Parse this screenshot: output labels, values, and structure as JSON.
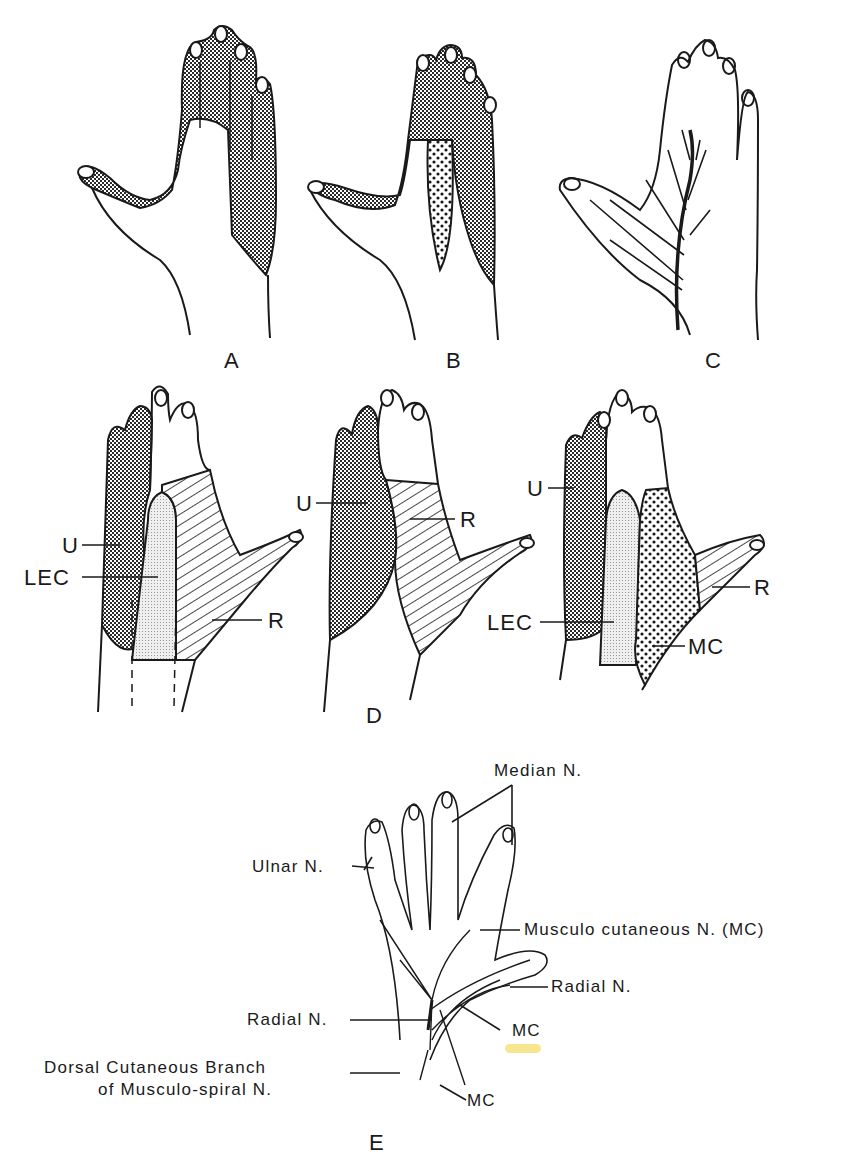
{
  "figure": {
    "panels": {
      "A": {
        "letter": "A"
      },
      "B": {
        "letter": "B"
      },
      "C": {
        "letter": "C"
      },
      "D": {
        "letter": "D",
        "hand1": {
          "labels": {
            "U": "U",
            "LEC": "LEC",
            "R": "R"
          }
        },
        "hand2": {
          "labels": {
            "U": "U",
            "R": "R"
          }
        },
        "hand3": {
          "labels": {
            "U": "U",
            "LEC": "LEC",
            "R": "R",
            "MC": "MC"
          }
        }
      },
      "E": {
        "letter": "E",
        "labels": {
          "median": "Median N.",
          "ulnar": "Ulnar N.",
          "musculo_cutaneous": "Musculo cutaneous N. (MC)",
          "radial_right": "Radial N.",
          "radial_left": "Radial N.",
          "mc_upper": "MC",
          "mc_lower": "MC",
          "dorsal_line1": "Dorsal Cutaneous Branch",
          "dorsal_line2": "of Musculo-spiral N."
        },
        "highlight_color": "#f6e27a"
      }
    },
    "colors": {
      "ink": "#1a1a1a",
      "background": "#ffffff",
      "dense_stipple": "#555555",
      "light_stipple": "#d9d9d9"
    }
  }
}
